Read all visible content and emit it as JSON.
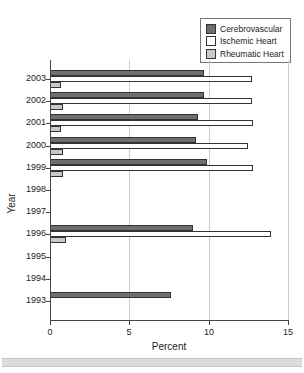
{
  "figure": {
    "xaxis_title": "Percent",
    "yaxis_title": "Year"
  },
  "colors": {
    "cerebrovascular": "#6e6e6e",
    "ischemic": "#ffffff",
    "rheumatic": "#c9c9c9",
    "gridline": "#cccccc",
    "axis": "#444444",
    "bottom_strip": "#dcdcdc"
  },
  "chart_data": {
    "type": "bar",
    "orientation": "horizontal",
    "title": "",
    "xlabel": "Percent",
    "ylabel": "Year",
    "xlim": [
      0,
      15
    ],
    "xticks": [
      0,
      5,
      10,
      15
    ],
    "grid": true,
    "legend_position": "top-right",
    "categories": [
      "2003",
      "2002",
      "2001",
      "2000",
      "1999",
      "1998",
      "1997",
      "1996",
      "1995",
      "1994",
      "1993"
    ],
    "series": [
      {
        "name": "Cerebrovascular",
        "key": "cerebrovascular",
        "color": "#6e6e6e",
        "border": "#333333",
        "values": [
          9.7,
          9.7,
          9.3,
          9.2,
          9.9,
          0,
          0,
          9.0,
          0,
          0,
          7.6
        ]
      },
      {
        "name": "Ischemic Heart",
        "key": "ischemic",
        "color": "#ffffff",
        "border": "#333333",
        "values": [
          12.7,
          12.7,
          12.8,
          12.5,
          12.8,
          0,
          0,
          13.9,
          0,
          0,
          0
        ]
      },
      {
        "name": "Rheumatic Heart",
        "key": "rheumatic",
        "color": "#c9c9c9",
        "border": "#333333",
        "values": [
          0.7,
          0.8,
          0.7,
          0.8,
          0.8,
          0,
          0,
          1.0,
          0,
          0,
          0
        ]
      }
    ]
  }
}
